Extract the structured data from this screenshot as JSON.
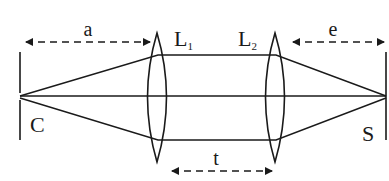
{
  "diagram": {
    "title": "",
    "colors": {
      "stroke": "#1a1a1a",
      "background": "#ffffff"
    },
    "labels": {
      "object": "C",
      "screen": "S",
      "lens1": "L",
      "lens1_sub": "1",
      "lens2": "L",
      "lens2_sub": "2",
      "dist_a": "a",
      "dist_t": "t",
      "dist_e": "e"
    },
    "elements": [
      {
        "id": "object-plane",
        "label": "C",
        "type": "vertical-line"
      },
      {
        "id": "lens-1",
        "label": "L1",
        "type": "biconvex-lens"
      },
      {
        "id": "lens-2",
        "label": "L2",
        "type": "biconvex-lens"
      },
      {
        "id": "screen-plane",
        "label": "S",
        "type": "vertical-line"
      }
    ],
    "dimensions": [
      {
        "label": "a",
        "from": "object-plane",
        "to": "lens-1"
      },
      {
        "label": "t",
        "from": "lens-1",
        "to": "lens-2"
      },
      {
        "label": "e",
        "from": "lens-2",
        "to": "screen-plane"
      }
    ]
  }
}
